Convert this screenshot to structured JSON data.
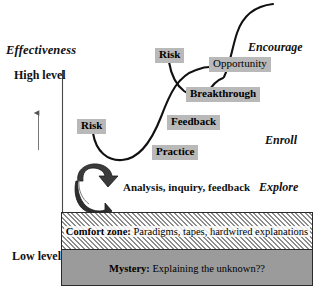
{
  "diagram": {
    "title_axis": {
      "effectiveness": "Effectiveness",
      "high_level": "High level",
      "low_level": "Low level"
    },
    "stage_words": {
      "encourage": "Encourage",
      "enroll": "Enroll",
      "explore": "Explore"
    },
    "curve_labels": {
      "risk_lower": "Risk",
      "risk_upper": "Risk",
      "practice": "Practice",
      "feedback": "Feedback",
      "breakthrough": "Breakthrough",
      "opportunity": "Opportunity"
    },
    "annotations": {
      "analysis": "Analysis, inquiry, feedback"
    },
    "zones": {
      "comfort": {
        "lead": "Comfort zone:",
        "rest": " Paradigms, tapes, hardwired explanations",
        "full": "Comfort zone: Paradigms, tapes, hardwired explanations"
      },
      "mystery": {
        "lead": "Mystery:",
        "rest": " Explaining the unknown??",
        "full": "Mystery: Explaining the unknown??"
      }
    },
    "colors": {
      "chip_fill": "#b9b9b9",
      "mystery_fill": "#9b9b9b",
      "stroke": "#1a1a1a",
      "hatch": "#8d8d8d"
    }
  }
}
